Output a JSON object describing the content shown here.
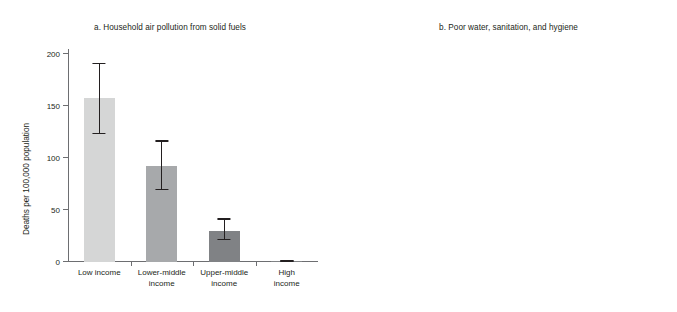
{
  "figure": {
    "ylabel": "Deaths per 100,000 population"
  },
  "chart_data": [
    {
      "type": "bar",
      "panel": "a",
      "title": "a. Household air pollution from solid fuels",
      "categories": [
        "Low income",
        "Lower-middle income",
        "Upper-middle income",
        "High income"
      ],
      "category_lines": [
        [
          "Low income"
        ],
        [
          "Lower-middle",
          "income"
        ],
        [
          "Upper-middle",
          "income"
        ],
        [
          "High income"
        ]
      ],
      "values": [
        158,
        92,
        30,
        1
      ],
      "error_low": [
        123,
        69,
        21,
        0
      ],
      "error_high": [
        192,
        117,
        42,
        2
      ],
      "xlabel": "",
      "ylabel": "Deaths per 100,000 population",
      "ylim": [
        0,
        205
      ],
      "yticks": [
        0,
        50,
        100,
        150,
        200
      ],
      "ytick_labels": [
        "0",
        "50",
        "100",
        "150",
        "200"
      ],
      "grid": false,
      "legend": "none",
      "bar_colors": [
        "#d5d6d6",
        "#a7a9ab",
        "#808285",
        "#808285"
      ],
      "error_color": "#231f20"
    },
    {
      "type": "bar",
      "panel": "b",
      "title": "b. Poor water, sanitation, and hygiene",
      "categories": [
        "Low income",
        "Lower-middle income",
        "Upper-middle income",
        "High income"
      ],
      "category_lines": [
        [
          "Low income"
        ],
        [
          "Lower-middle",
          "income"
        ],
        [
          "Upper-middle",
          "income"
        ],
        [
          "High income"
        ]
      ],
      "values": [
        96,
        52,
        6.5,
        2.5
      ],
      "error_low": [
        83,
        47,
        5,
        1.6
      ],
      "error_high": [
        105,
        59,
        8.5,
        3.5
      ],
      "xlabel": "",
      "ylabel": "Deaths per 100,000 population",
      "ylim": [
        0,
        108
      ],
      "yticks": [
        0,
        30,
        60,
        90
      ],
      "ytick_labels": [
        "0",
        "30",
        "60",
        "90"
      ],
      "grid": false,
      "legend": "none",
      "bar_colors": [
        "#d5d6d6",
        "#a7a9ab",
        "#808285",
        "#808285"
      ],
      "error_color": "#231f20"
    }
  ]
}
